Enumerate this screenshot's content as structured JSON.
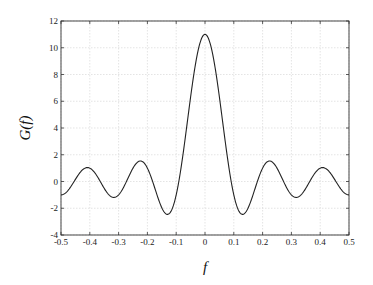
{
  "chart_data": {
    "type": "line",
    "title": "",
    "xlabel": "f",
    "ylabel": "G(f)",
    "xlim": [
      -0.5,
      0.5
    ],
    "ylim": [
      -4,
      12
    ],
    "grid": true,
    "legend": null,
    "x_ticks": [
      -0.5,
      -0.4,
      -0.3,
      -0.2,
      -0.1,
      0,
      0.1,
      0.2,
      0.3,
      0.4,
      0.5
    ],
    "x_tick_labels": [
      "-0.5",
      "-0.4",
      "-0.3",
      "-0.2",
      "-0.1",
      "0",
      "0.1",
      "0.2",
      "0.3",
      "0.4",
      "0.5"
    ],
    "y_ticks": [
      -4,
      -2,
      0,
      2,
      4,
      6,
      8,
      10,
      12
    ],
    "y_tick_labels": [
      "-4",
      "-2",
      "0",
      "2",
      "4",
      "6",
      "8",
      "10",
      "12"
    ],
    "series": [
      {
        "name": "G(f)",
        "color": "#222222",
        "formula": "sin(11*pi*f)/sin(pi*f)",
        "x": [
          -0.5,
          -0.45,
          -0.41,
          -0.36,
          -0.318,
          -0.27,
          -0.227,
          -0.18,
          -0.136,
          -0.091,
          -0.05,
          0,
          0.05,
          0.091,
          0.136,
          0.18,
          0.227,
          0.27,
          0.318,
          0.36,
          0.41,
          0.45,
          0.5
        ],
        "values": [
          -1.0,
          0.0,
          1.04,
          0.0,
          -1.19,
          0.0,
          1.54,
          0.0,
          -2.38,
          0.0,
          6.39,
          11.0,
          6.39,
          0.0,
          -2.38,
          0.0,
          1.54,
          0.0,
          -1.19,
          0.0,
          1.04,
          0.0,
          -1.0
        ]
      }
    ],
    "key_points": {
      "main_peak": {
        "f": 0,
        "G": 11
      },
      "first_zero": {
        "f": 0.091,
        "G": 0
      },
      "first_negative_min": {
        "f": 0.136,
        "G": -2.38
      },
      "second_peak": {
        "f": 0.227,
        "G": 1.54
      },
      "second_negative_min": {
        "f": 0.318,
        "G": -1.19
      },
      "third_peak": {
        "f": 0.41,
        "G": 1.04
      },
      "edge_value": {
        "f": 0.5,
        "G": -1.0
      }
    }
  },
  "layout": {
    "plot_left": 61,
    "plot_right": 349,
    "plot_top": 21,
    "plot_bottom": 235,
    "grid_color": "#d9d9d9",
    "axis_color": "#333333",
    "line_color": "#222222"
  }
}
